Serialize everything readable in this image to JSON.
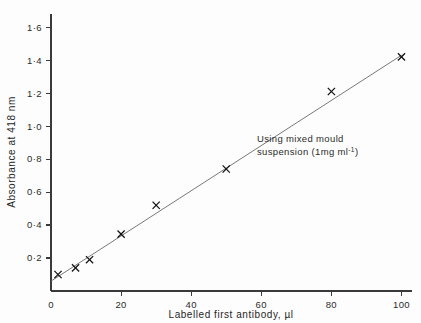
{
  "figure": {
    "background_color": "#fdfdfd",
    "ink_color": "#1a1a1a"
  },
  "annotation": {
    "line1": "Using mixed mould",
    "line2_prefix": "suspension  (1mg ml",
    "line2_sup": "-1",
    "line2_suffix": ")"
  },
  "chart_data": {
    "type": "scatter",
    "title": "",
    "subtitle": "",
    "xlabel": "Labelled first antibody,  µl",
    "ylabel": "Absorbance at  418 nm",
    "xlim": [
      0,
      103
    ],
    "ylim": [
      0,
      1.68
    ],
    "grid": false,
    "legend": null,
    "xticks": [
      0,
      20,
      40,
      60,
      80,
      100
    ],
    "xticklabels": [
      "0",
      "20",
      "40",
      "60",
      "80",
      "100"
    ],
    "yticks": [
      0.2,
      0.4,
      0.6,
      0.8,
      1.0,
      1.2,
      1.4,
      1.6
    ],
    "yticklabels": [
      "0·2",
      "0·4",
      "0·6",
      "0·8",
      "1·0",
      "1·2",
      "1·4",
      "1·6"
    ],
    "marker": "x",
    "x": [
      2,
      7,
      11,
      20,
      30,
      50,
      80,
      100
    ],
    "y": [
      0.1,
      0.14,
      0.19,
      0.345,
      0.52,
      0.74,
      1.21,
      1.42
    ],
    "series": [
      {
        "name": "Absorbance at 418 nm",
        "points": [
          {
            "x": 2,
            "y": 0.1
          },
          {
            "x": 7,
            "y": 0.14
          },
          {
            "x": 11,
            "y": 0.19
          },
          {
            "x": 20,
            "y": 0.345
          },
          {
            "x": 30,
            "y": 0.52
          },
          {
            "x": 50,
            "y": 0.74
          },
          {
            "x": 80,
            "y": 1.21
          },
          {
            "x": 100,
            "y": 1.42
          }
        ]
      }
    ],
    "fit_line": {
      "type": "linear",
      "x_start": 0,
      "y_start": 0.06,
      "x_end": 100,
      "y_end": 1.43
    },
    "annotations": [
      {
        "text": "Using mixed mould suspension  (1mg ml-1)",
        "x": 57,
        "y": 0.98
      }
    ]
  }
}
